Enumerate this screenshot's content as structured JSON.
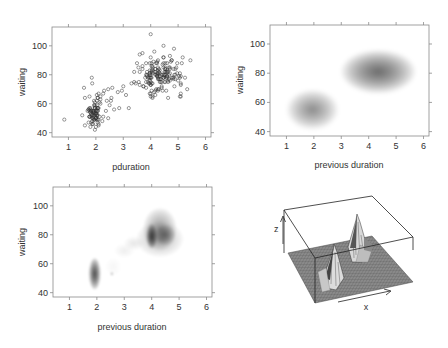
{
  "chart_data": [
    {
      "id": "scatter",
      "type": "scatter",
      "title": "",
      "xlabel": "pduration",
      "ylabel": "waiting",
      "xlim": [
        0.4,
        6.2
      ],
      "ylim": [
        37,
        113
      ],
      "xticks": [
        1,
        2,
        3,
        4,
        5,
        6
      ],
      "yticks": [
        40,
        60,
        80,
        100
      ],
      "grid": false,
      "marker": "open-circle",
      "clusters": [
        {
          "name": "short",
          "cx": 1.95,
          "cy": 54,
          "sx": 0.18,
          "sy": 6.0,
          "n": 95
        },
        {
          "name": "long",
          "cx": 4.35,
          "cy": 80,
          "sx": 0.42,
          "sy": 6.5,
          "n": 170
        }
      ],
      "points_extra": [
        [
          0.85,
          49
        ],
        [
          1.85,
          78
        ],
        [
          2.45,
          70
        ],
        [
          2.6,
          71
        ],
        [
          2.8,
          68
        ],
        [
          2.95,
          69
        ],
        [
          3.0,
          72
        ],
        [
          3.1,
          66
        ],
        [
          2.85,
          57
        ],
        [
          2.5,
          59
        ],
        [
          2.45,
          50
        ],
        [
          3.3,
          74
        ],
        [
          3.45,
          74
        ],
        [
          3.6,
          73
        ],
        [
          3.7,
          95
        ],
        [
          4.0,
          108
        ],
        [
          5.45,
          90
        ],
        [
          5.25,
          78
        ],
        [
          4.85,
          98
        ],
        [
          4.0,
          65
        ],
        [
          3.55,
          85
        ],
        [
          2.3,
          69
        ],
        [
          2.55,
          62
        ],
        [
          1.5,
          52
        ]
      ]
    },
    {
      "id": "smooth-density",
      "type": "heatmap",
      "title": "",
      "xlabel": "previous duration",
      "ylabel": "waiting",
      "xlim": [
        0.4,
        6.2
      ],
      "ylim": [
        37,
        113
      ],
      "xticks": [
        1,
        2,
        3,
        4,
        5,
        6
      ],
      "yticks": [
        40,
        60,
        80,
        100
      ],
      "grid": false,
      "colormap": "greyscale",
      "components": [
        {
          "cx": 1.95,
          "cy": 55,
          "sx": 0.38,
          "sy": 5.5,
          "weight": 0.55
        },
        {
          "cx": 4.35,
          "cy": 81,
          "sx": 0.55,
          "sy": 6.0,
          "weight": 0.75
        }
      ]
    },
    {
      "id": "sharp-density",
      "type": "heatmap",
      "title": "",
      "xlabel": "previous duration",
      "ylabel": "waiting",
      "xlim": [
        0.4,
        6.2
      ],
      "ylim": [
        37,
        113
      ],
      "xticks": [
        1,
        2,
        3,
        4,
        5,
        6
      ],
      "yticks": [
        40,
        60,
        80,
        100
      ],
      "grid": false,
      "colormap": "greyscale",
      "components": [
        {
          "cx": 1.92,
          "cy": 53,
          "sx": 0.09,
          "sy": 4.5,
          "weight": 1.0
        },
        {
          "cx": 4.0,
          "cy": 79,
          "sx": 0.08,
          "sy": 3.5,
          "weight": 1.0
        },
        {
          "cx": 4.3,
          "cy": 84,
          "sx": 0.25,
          "sy": 6.0,
          "weight": 0.45
        },
        {
          "cx": 4.5,
          "cy": 80,
          "sx": 0.15,
          "sy": 3.0,
          "weight": 0.45
        },
        {
          "cx": 4.3,
          "cy": 77,
          "sx": 0.35,
          "sy": 5.0,
          "weight": 0.3
        },
        {
          "cx": 3.35,
          "cy": 74,
          "sx": 0.15,
          "sy": 2.0,
          "weight": 0.12
        },
        {
          "cx": 3.0,
          "cy": 69,
          "sx": 0.15,
          "sy": 2.0,
          "weight": 0.08
        },
        {
          "cx": 2.6,
          "cy": 58,
          "sx": 0.12,
          "sy": 2.5,
          "weight": 0.06
        },
        {
          "cx": 2.55,
          "cy": 53,
          "sx": 0.02,
          "sy": 0.5,
          "weight": 0.5
        }
      ]
    },
    {
      "id": "perspective-surface",
      "type": "surface-3d",
      "title": "",
      "axis_labels": {
        "x": "x",
        "z": "z"
      },
      "peaks": [
        {
          "name": "short-peak",
          "relative_height": 0.65
        },
        {
          "name": "long-peak",
          "relative_height": 1.0
        }
      ]
    }
  ],
  "panels": {
    "scatter": {
      "xlabel": "pduration",
      "ylabel": "waiting"
    },
    "smooth": {
      "xlabel": "previous duration",
      "ylabel": "waiting"
    },
    "sharp": {
      "xlabel": "previous duration",
      "ylabel": "waiting"
    },
    "surface": {
      "xlabel": "x",
      "zlabel": "z"
    }
  },
  "tick_labels": {
    "x": [
      "1",
      "2",
      "3",
      "4",
      "5",
      "6"
    ],
    "y": [
      "40",
      "60",
      "80",
      "100"
    ]
  },
  "colors": {
    "frame": "#8a8a8a",
    "point": "#333333",
    "density": "#000000"
  }
}
